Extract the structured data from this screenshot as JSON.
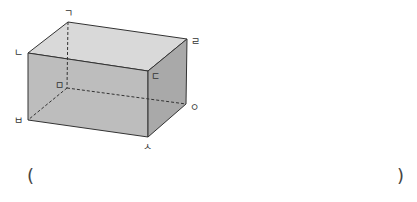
{
  "figure": {
    "type": "rectangular cuboid (직육면체)",
    "colors": {
      "top_face": "#d9d9d9",
      "front_face": "#bdbdbd",
      "right_face": "#a9a9a9",
      "edge": "#333333",
      "hidden_edge": "#333333"
    },
    "vertices": [
      {
        "id": "giyeok",
        "label": "ㄱ",
        "x": 68,
        "y": 22,
        "lx": 68,
        "ly": 15
      },
      {
        "id": "nieun",
        "label": "ㄴ",
        "x": 28,
        "y": 53,
        "lx": 20,
        "ly": 54
      },
      {
        "id": "digeut",
        "label": "ㄷ",
        "x": 148,
        "y": 71,
        "lx": 156,
        "ly": 78
      },
      {
        "id": "rieul",
        "label": "ㄹ",
        "x": 187,
        "y": 39,
        "lx": 197,
        "ly": 43
      },
      {
        "id": "mieum",
        "label": "ㅁ",
        "x": 67,
        "y": 88,
        "lx": 60,
        "ly": 87
      },
      {
        "id": "bieup",
        "label": "ㅂ",
        "x": 28,
        "y": 120,
        "lx": 20,
        "ly": 123
      },
      {
        "id": "siot",
        "label": "ㅅ",
        "x": 148,
        "y": 137,
        "lx": 149,
        "ly": 149
      },
      {
        "id": "ieung",
        "label": "ㅇ",
        "x": 186,
        "y": 104,
        "lx": 194,
        "ly": 110
      }
    ]
  },
  "answer": {
    "open_paren": "(",
    "close_paren": ")",
    "value": ""
  }
}
